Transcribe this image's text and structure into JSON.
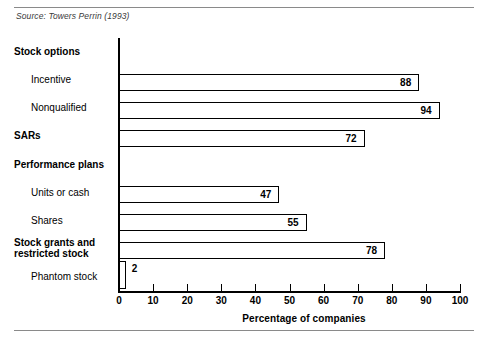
{
  "source_note": "Source: Towers Perrin (1993)",
  "clipped_heading": "",
  "axis": {
    "xlabel": "Percentage of companies",
    "ticks": [
      "0",
      "10",
      "20",
      "30",
      "40",
      "50",
      "60",
      "70",
      "80",
      "90",
      "100"
    ]
  },
  "categories": [
    {
      "label": "Stock options",
      "type": "group",
      "value": null
    },
    {
      "label": "Incentive",
      "type": "sub",
      "value": 88
    },
    {
      "label": "Nonqualified",
      "type": "sub",
      "value": 94
    },
    {
      "label": "SARs",
      "type": "group",
      "value": 72
    },
    {
      "label": "Performance plans",
      "type": "group",
      "value": null
    },
    {
      "label": "Units or cash",
      "type": "sub",
      "value": 47
    },
    {
      "label": "Shares",
      "type": "sub",
      "value": 55
    },
    {
      "label": "Stock grants and restricted stock",
      "type": "group",
      "value": 78
    },
    {
      "label": "Phantom stock",
      "type": "sub",
      "value": 2
    }
  ],
  "chart_data": {
    "type": "bar",
    "orientation": "horizontal",
    "title": "",
    "subtitle": "",
    "xlabel": "Percentage of companies",
    "ylabel": "",
    "xlim": [
      0,
      100
    ],
    "xticks": [
      0,
      10,
      20,
      30,
      40,
      50,
      60,
      70,
      80,
      90,
      100
    ],
    "grid": false,
    "legend": null,
    "bar_style": {
      "fill": "#ffffff",
      "edge": "#000000"
    },
    "data_labels": true,
    "categories": [
      "Incentive",
      "Nonqualified",
      "SARs",
      "Units or cash",
      "Shares",
      "Stock grants and restricted stock",
      "Phantom stock"
    ],
    "values": [
      88,
      94,
      72,
      47,
      55,
      78,
      2
    ],
    "group_headers": [
      "Stock options",
      "Performance plans"
    ],
    "annotations": [
      "Source: Towers Perrin (1993)"
    ]
  }
}
